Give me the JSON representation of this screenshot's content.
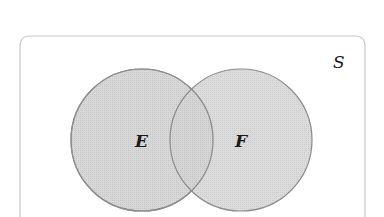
{
  "diagram": {
    "type": "venn",
    "universe": {
      "label": "S"
    },
    "sets": [
      {
        "id": "E",
        "label": "E"
      },
      {
        "id": "F",
        "label": "F"
      }
    ],
    "colors": {
      "fill": "#d4d4d4",
      "circle_stroke": "#8c8c8c",
      "box_stroke": "#c8c8c8",
      "text": "#1a1a1a"
    }
  }
}
